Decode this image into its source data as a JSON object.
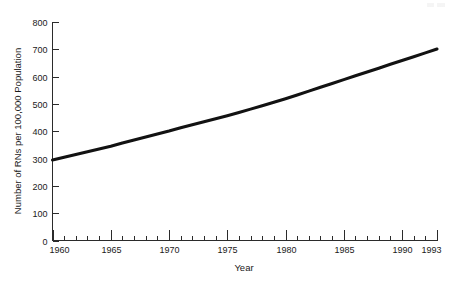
{
  "chart_data": {
    "type": "line",
    "title": "",
    "xlabel": "Year",
    "ylabel": "Number of RNs per 100,000 Population",
    "xlim": [
      1960,
      1993
    ],
    "ylim": [
      0,
      800
    ],
    "grid": false,
    "legend": null,
    "x_ticks_major": [
      1960,
      1965,
      1970,
      1975,
      1980,
      1985,
      1990,
      1993
    ],
    "x_tick_labels": [
      "1960",
      "1965",
      "1970",
      "1975",
      "1980",
      "1985",
      "1990",
      "1993"
    ],
    "y_ticks": [
      0,
      100,
      200,
      300,
      400,
      500,
      600,
      700,
      800
    ],
    "y_tick_labels": [
      "0",
      "100",
      "200",
      "300",
      "400",
      "500",
      "600",
      "700",
      "800"
    ],
    "x_minor_tick_interval": 1,
    "series": [
      {
        "name": "RNs per 100,000 Population",
        "color": "#121212",
        "x": [
          1960,
          1961,
          1962,
          1963,
          1964,
          1965,
          1966,
          1967,
          1968,
          1969,
          1970,
          1971,
          1972,
          1973,
          1974,
          1975,
          1976,
          1977,
          1978,
          1979,
          1980,
          1981,
          1982,
          1983,
          1984,
          1985,
          1986,
          1987,
          1988,
          1989,
          1990,
          1991,
          1992,
          1993
        ],
        "values": [
          295,
          305,
          315,
          325,
          335,
          345,
          357,
          368,
          379,
          390,
          401,
          413,
          424,
          435,
          446,
          457,
          469,
          481,
          493,
          506,
          519,
          533,
          547,
          561,
          575,
          589,
          603,
          617,
          631,
          645,
          659,
          673,
          687,
          701
        ]
      }
    ]
  },
  "axis": {
    "y_title": "Number of RNs per 100,000 Population",
    "x_title": "Year"
  }
}
